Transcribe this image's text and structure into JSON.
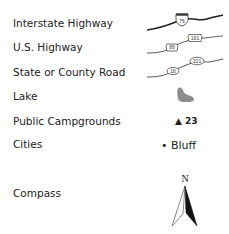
{
  "legend": {
    "items": [
      {
        "label": "Interstate Highway",
        "symbol": "interstate-road-line",
        "shields": [
          "76"
        ]
      },
      {
        "label": "U.S. Highway",
        "symbol": "us-highway-road-line",
        "shields": [
          "89",
          "191"
        ]
      },
      {
        "label": "State or County Road",
        "symbol": "state-road-line",
        "shields": [
          "16",
          "101"
        ]
      },
      {
        "label": "Lake",
        "symbol": "lake-shape"
      },
      {
        "label": "Public Campgrounds",
        "symbol": "campground-triangle",
        "example": "23",
        "glyph": "▲"
      },
      {
        "label": "Cities",
        "symbol": "city-dot",
        "example": "Bluff",
        "glyph": "•"
      },
      {
        "label": "Compass",
        "symbol": "north-arrow",
        "direction": "N"
      }
    ]
  },
  "colors": {
    "text": "#222222",
    "road": "#222222",
    "lake": "#8c8c8c",
    "background": "#ffffff"
  }
}
